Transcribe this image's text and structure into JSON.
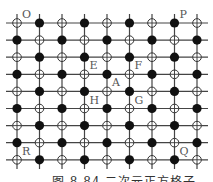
{
  "diagram": {
    "type": "square-lattice",
    "rows": 9,
    "cols": 9,
    "x0": 17,
    "dx": 22.5,
    "y0": 23,
    "dy": 17.1,
    "line_extent": {
      "x_min": 6,
      "x_max": 208,
      "y_min": 14,
      "y_max": 169
    },
    "node_rule": "open-cross when (row+col) even, filled when (row+col) odd",
    "colors": {
      "line": "#444444",
      "filled": "#111111",
      "open_stroke": "#333333",
      "open_fill": "#ffffff",
      "label": "#555555"
    },
    "labels": [
      {
        "text": "O",
        "row": 0,
        "col": 0
      },
      {
        "text": "P",
        "row": 0,
        "col": 7
      },
      {
        "text": "E",
        "row": 3,
        "col": 3
      },
      {
        "text": "F",
        "row": 3,
        "col": 5
      },
      {
        "text": "A",
        "row": 4,
        "col": 4
      },
      {
        "text": "H",
        "row": 5,
        "col": 3
      },
      {
        "text": "G",
        "row": 5,
        "col": 5
      },
      {
        "text": "R",
        "row": 8,
        "col": 0
      },
      {
        "text": "Q",
        "row": 8,
        "col": 7
      }
    ]
  },
  "caption": "图 8.84  二次元正方格子"
}
